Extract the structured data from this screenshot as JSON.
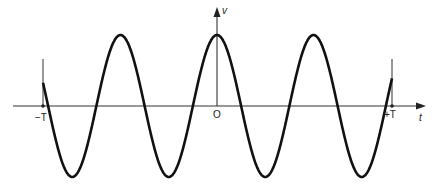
{
  "chart_data": {
    "type": "line",
    "title": "",
    "xlabel": "t",
    "ylabel": "v",
    "x_ticks": [
      "-T",
      "O",
      "+T"
    ],
    "series": [
      {
        "name": "v(t)",
        "function": "cos",
        "cycles_in_window": 3.6
      }
    ]
  },
  "labels": {
    "neg_T": "−T",
    "origin": "O",
    "pos_T": "+T",
    "t_axis": "t",
    "v_axis": "v"
  }
}
